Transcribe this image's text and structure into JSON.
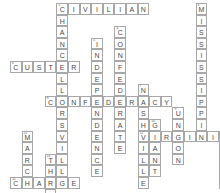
{
  "puzzle": {
    "title": "Civil War Crossword Grid",
    "grid": {
      "cell_size": 11.6,
      "origin_x": 10,
      "origin_y": 3,
      "columns": 18,
      "rows": 16
    },
    "style": {
      "cell_border": "#a8a8a8",
      "cell_fill": "#ffffff",
      "letter_color": "#4a4a4a",
      "number_color": "#555555",
      "page_background": "#ffffff"
    },
    "entries": [
      {
        "number": "1",
        "answer": "CIVILIAN",
        "direction": "across",
        "row": 0,
        "col": 4,
        "length": 8
      },
      {
        "number": "2",
        "answer": "CHANCELLORSVILLE",
        "direction": "down",
        "row": 0,
        "col": 4,
        "length": 16
      },
      {
        "number": "3",
        "answer": "MISSISSIPPI",
        "direction": "down",
        "row": 0,
        "col": 16,
        "length": 11
      },
      {
        "number": "4",
        "answer": "CONFEDERATE",
        "direction": "down",
        "row": 2,
        "col": 9,
        "length": 11
      },
      {
        "number": "5",
        "answer": "INDEPENDENCE",
        "direction": "down",
        "row": 3,
        "col": 7,
        "length": 12
      },
      {
        "number": "6",
        "answer": "CUSTER",
        "direction": "across",
        "row": 5,
        "col": 0,
        "length": 6
      },
      {
        "number": "7",
        "answer": "NASHVILLE",
        "direction": "down",
        "row": 7,
        "col": 11,
        "length": 9
      },
      {
        "number": "8",
        "answer": "CONFEDERACY",
        "direction": "across",
        "row": 8,
        "col": 3,
        "length": 11
      },
      {
        "number": "9",
        "answer": "UNION",
        "direction": "down",
        "row": 9,
        "col": 14,
        "length": 5
      },
      {
        "number": "10",
        "answer": "GRANT",
        "direction": "down",
        "row": 10,
        "col": 12,
        "length": 5
      },
      {
        "number": "11",
        "answer": "MARCH",
        "direction": "down",
        "row": 11,
        "col": 1,
        "length": 5
      },
      {
        "number": "12",
        "answer": "VIRGINIA",
        "direction": "across",
        "row": 11,
        "col": 11,
        "length": 8
      },
      {
        "number": "13",
        "answer": "APRIL",
        "direction": "down",
        "row": 11,
        "col": 18,
        "length": 5
      },
      {
        "number": "14",
        "answer": "THER",
        "direction": "down",
        "row": 13,
        "col": 3,
        "length": 4
      },
      {
        "number": "15",
        "answer": "CHARGE",
        "direction": "across",
        "row": 15,
        "col": 0,
        "length": 6
      },
      {
        "number": "16",
        "answer": "THREE",
        "direction": "across",
        "row": 17,
        "col": 0,
        "length": 5
      }
    ]
  }
}
